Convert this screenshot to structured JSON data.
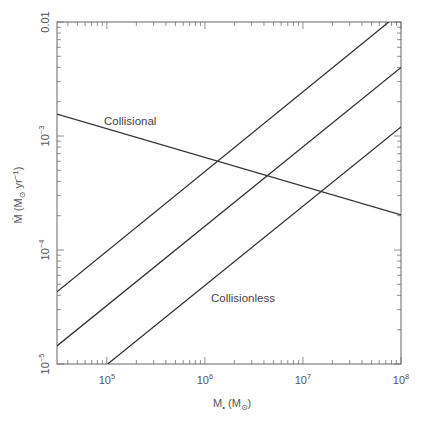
{
  "chart_data": {
    "type": "line",
    "title": "",
    "xlabel": "M• (M☉)",
    "ylabel": "Ṁ (M☉ yr⁻¹)",
    "xscale": "log",
    "yscale": "log",
    "xlim": [
      31000,
      100000000
    ],
    "ylim": [
      1e-05,
      0.01
    ],
    "x_ticks": [
      {
        "value": 100000,
        "label": "10",
        "exp": "5"
      },
      {
        "value": 1000000,
        "label": "10",
        "exp": "6"
      },
      {
        "value": 10000000,
        "label": "10",
        "exp": "7"
      },
      {
        "value": 100000000,
        "label": "10",
        "exp": "8"
      }
    ],
    "y_ticks": [
      {
        "value": 0.01,
        "label": "0.01",
        "exp": ""
      },
      {
        "value": 0.001,
        "label": "10",
        "exp": "−3"
      },
      {
        "value": 0.0001,
        "label": "10",
        "exp": "−4"
      },
      {
        "value": 1e-05,
        "label": "10",
        "exp": "−5"
      }
    ],
    "grid": false,
    "legend": null,
    "series": [
      {
        "name": "Collisional",
        "x": [
          31000,
          100000000
        ],
        "y": [
          0.00156,
          0.000203
        ]
      },
      {
        "name": "Collisionless (upper)",
        "x": [
          31000,
          75000000
        ],
        "y": [
          4.3e-05,
          0.01
        ]
      },
      {
        "name": "Collisionless (middle)",
        "x": [
          31000,
          100000000
        ],
        "y": [
          1.44e-05,
          0.004
        ]
      },
      {
        "name": "Collisionless (lower)",
        "x": [
          102000,
          100000000
        ],
        "y": [
          1e-05,
          0.0012
        ]
      }
    ],
    "annotations": [
      {
        "text": "Collisional",
        "x": 200000,
        "y": 0.0012
      },
      {
        "text": "Collisionless",
        "x": 1500000,
        "y": 2.8e-05
      }
    ]
  },
  "labels": {
    "collisional": "Collisional",
    "collisionless": "Collisionless",
    "x_title_main": "M",
    "x_title_sub": "•",
    "x_title_unit_open": " (M",
    "x_title_unit_sub": "⊙",
    "x_title_unit_close": ")",
    "y_title_main": "Ṁ",
    "y_title_unit_open": " (M",
    "y_title_unit_sub": "⊙",
    "y_title_unit_mid": " yr",
    "y_title_unit_sup": "−1",
    "y_title_unit_close": ")"
  }
}
